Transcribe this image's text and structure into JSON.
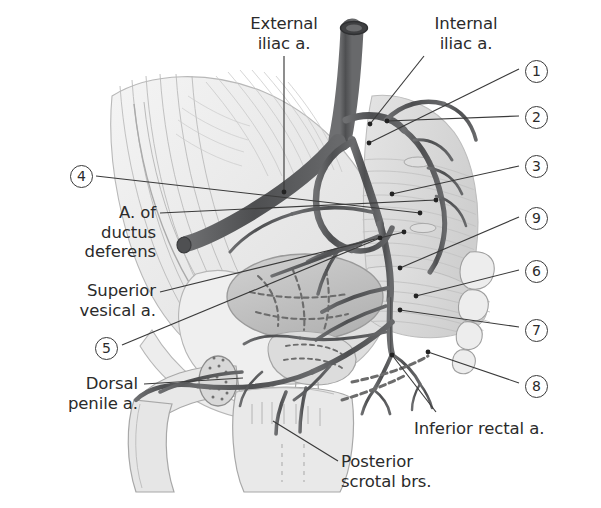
{
  "figure": {
    "width": 601,
    "height": 508,
    "background": "#ffffff",
    "line_color": "#3a3a3a",
    "text_color": "#2b2b2b",
    "vessel_color": "#58595b",
    "vessel_dark": "#4a4a4c",
    "bone_fill": "#e9e9e9",
    "bladder_fill": "#bfbfbf"
  },
  "labels": [
    {
      "id": "external-iliac",
      "text": "External\niliac a.",
      "x": 228,
      "y": 14,
      "align": "center",
      "w": 112
    },
    {
      "id": "internal-iliac",
      "text": "Internal\niliac a.",
      "x": 414,
      "y": 14,
      "align": "center",
      "w": 104
    },
    {
      "id": "a-ductus-deferens",
      "text": "A. of\nductus\ndeferens",
      "x": 36,
      "y": 203,
      "align": "right",
      "w": 120
    },
    {
      "id": "superior-vesical",
      "text": "Superior\nvesical a.",
      "x": 36,
      "y": 281,
      "align": "right",
      "w": 120
    },
    {
      "id": "dorsal-penile",
      "text": "Dorsal\npenile a.",
      "x": 18,
      "y": 374,
      "align": "right",
      "w": 120
    },
    {
      "id": "inferior-rectal",
      "text": "Inferior rectal a.",
      "x": 414,
      "y": 419,
      "align": "left",
      "w": 180
    },
    {
      "id": "posterior-scrotal",
      "text": "Posterior\nscrotal brs.",
      "x": 341,
      "y": 452,
      "align": "left",
      "w": 170
    }
  ],
  "numbers": [
    {
      "id": "n1",
      "value": "1",
      "x": 525,
      "y": 60
    },
    {
      "id": "n2",
      "value": "2",
      "x": 525,
      "y": 106
    },
    {
      "id": "n3",
      "value": "3",
      "x": 525,
      "y": 155
    },
    {
      "id": "n9",
      "value": "9",
      "x": 525,
      "y": 207
    },
    {
      "id": "n6",
      "value": "6",
      "x": 525,
      "y": 260
    },
    {
      "id": "n7",
      "value": "7",
      "x": 525,
      "y": 319
    },
    {
      "id": "n8",
      "value": "8",
      "x": 525,
      "y": 375
    },
    {
      "id": "n4",
      "value": "4",
      "x": 70,
      "y": 165
    },
    {
      "id": "n5",
      "value": "5",
      "x": 95,
      "y": 337
    }
  ],
  "leaders": [
    {
      "id": "leader-external-iliac",
      "from": [
        284,
        56
      ],
      "to": [
        284,
        192
      ],
      "dot": true
    },
    {
      "id": "leader-internal-iliac",
      "from": [
        424,
        56
      ],
      "to": [
        370,
        124
      ],
      "dot": true
    },
    {
      "id": "leader-n1",
      "from": [
        519,
        69
      ],
      "to": [
        369,
        143
      ],
      "dot": true
    },
    {
      "id": "leader-n2",
      "from": [
        519,
        116
      ],
      "to": [
        387,
        121
      ],
      "dot": true
    },
    {
      "id": "leader-n3",
      "from": [
        519,
        166
      ],
      "to": [
        392,
        194
      ],
      "dot": true
    },
    {
      "id": "leader-n9",
      "from": [
        519,
        217
      ],
      "to": [
        400,
        268
      ],
      "dot": true
    },
    {
      "id": "leader-n6",
      "from": [
        519,
        270
      ],
      "to": [
        416,
        296
      ],
      "dot": true
    },
    {
      "id": "leader-n7",
      "from": [
        519,
        327
      ],
      "to": [
        400,
        310
      ],
      "dot": true
    },
    {
      "id": "leader-n8",
      "from": [
        519,
        383
      ],
      "to": [
        428,
        352
      ],
      "dot": true
    },
    {
      "id": "leader-n4",
      "from": [
        96,
        176
      ],
      "to": [
        420,
        213
      ],
      "dot": true
    },
    {
      "id": "leader-ductus",
      "from": [
        160,
        213
      ],
      "to": [
        436,
        200
      ],
      "dot": true
    },
    {
      "id": "leader-superior-vesical",
      "from": [
        160,
        292
      ],
      "to": [
        404,
        232
      ],
      "dot": true
    },
    {
      "id": "leader-n5",
      "from": [
        122,
        345
      ],
      "to": [
        380,
        238
      ],
      "dot": true
    },
    {
      "id": "leader-dorsal-penile",
      "from": [
        144,
        384
      ],
      "to": [
        243,
        378
      ],
      "dot": false
    },
    {
      "id": "leader-inferior-rectal",
      "from": [
        436,
        412
      ],
      "to": [
        392,
        355
      ],
      "dot": true
    },
    {
      "id": "leader-posterior-scrotal",
      "from": [
        338,
        461
      ],
      "to": [
        273,
        421
      ],
      "dot": false
    }
  ]
}
